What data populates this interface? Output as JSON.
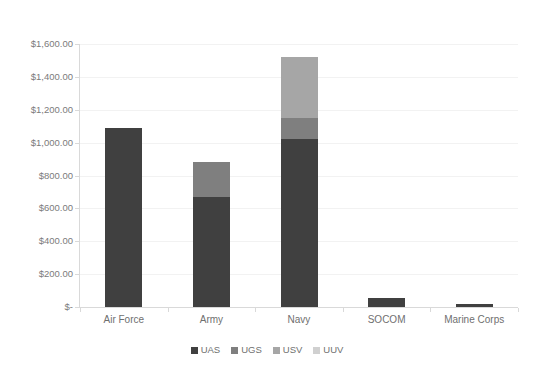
{
  "chart_data": {
    "type": "bar",
    "subtype": "stacked-column",
    "title": "",
    "xlabel": "",
    "ylabel": "",
    "ylim": [
      0,
      1600
    ],
    "ytick_step": 200,
    "ytick_labels": [
      "$1,600.00",
      "$1,400.00",
      "$1,200.00",
      "$1,000.00",
      "$800.00",
      "$600.00",
      "$400.00",
      "$200.00",
      "$-"
    ],
    "ytick_values": [
      1600,
      1400,
      1200,
      1000,
      800,
      600,
      400,
      200,
      0
    ],
    "categories": [
      "Air Force",
      "Army",
      "Navy",
      "SOCOM",
      "Marine Corps"
    ],
    "grid": true,
    "legend_position": "bottom",
    "series": [
      {
        "name": "UAS",
        "color": "#404040",
        "values": [
          1090,
          670,
          1020,
          55,
          20
        ]
      },
      {
        "name": "UGS",
        "color": "#7f7f7f",
        "values": [
          0,
          210,
          130,
          0,
          0
        ]
      },
      {
        "name": "USV",
        "color": "#a6a6a6",
        "values": [
          0,
          0,
          370,
          0,
          0
        ]
      },
      {
        "name": "UUV",
        "color": "#d0d0d0",
        "values": [
          0,
          0,
          0,
          0,
          0
        ]
      }
    ],
    "totals": [
      1090,
      880,
      1520,
      55,
      20
    ]
  },
  "legend": {
    "items": [
      {
        "label": "UAS",
        "color": "#404040"
      },
      {
        "label": "UGS",
        "color": "#7f7f7f"
      },
      {
        "label": "USV",
        "color": "#a6a6a6"
      },
      {
        "label": "UUV",
        "color": "#d0d0d0"
      }
    ]
  },
  "colors": {
    "axis": "#d9d9d9",
    "grid": "#f2f2f2",
    "text": "#6f6f6f",
    "background": "#ffffff"
  }
}
